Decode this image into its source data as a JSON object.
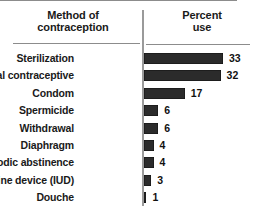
{
  "chart_data": {
    "type": "bar",
    "orientation": "horizontal",
    "title": "",
    "xlabel": "Percent use",
    "ylabel": "Method of contraception",
    "categories": [
      "Sterilization",
      "Oral contraceptive",
      "Condom",
      "Spermicide",
      "Withdrawal",
      "Diaphragm",
      "Periodic abstinence",
      "Intrauterine device (IUD)",
      "Douche"
    ],
    "values": [
      33,
      32,
      17,
      6,
      6,
      4,
      4,
      3,
      1
    ],
    "value_labels": [
      "33",
      "32",
      "17",
      "6",
      "6",
      "4",
      "4",
      "3",
      "1"
    ],
    "xlim": [
      0,
      33
    ],
    "grid": false,
    "legend": null,
    "bar_color": "#2b2b2b",
    "axis_color": "#9a9a9a",
    "rule_color": "#8c8c8c",
    "text_color": "#1a1a1a",
    "background": "#ffffff"
  },
  "header": {
    "left_line1": "Method of",
    "left_line2": "contraception",
    "right_line1": "Percent",
    "right_line2": "use"
  },
  "rows": [
    {
      "label": "Sterilization",
      "value": 33,
      "value_label": "33"
    },
    {
      "label": "Oral contraceptive",
      "value": 32,
      "value_label": "32"
    },
    {
      "label": "Condom",
      "value": 17,
      "value_label": "17"
    },
    {
      "label": "Spermicide",
      "value": 6,
      "value_label": "6"
    },
    {
      "label": "Withdrawal",
      "value": 6,
      "value_label": "6"
    },
    {
      "label": "Diaphragm",
      "value": 4,
      "value_label": "4"
    },
    {
      "label": "Periodic abstinence",
      "value": 4,
      "value_label": "4"
    },
    {
      "label": "Intrauterine device (IUD)",
      "value": 3,
      "value_label": "3"
    },
    {
      "label": "Douche",
      "value": 1,
      "value_label": "1"
    }
  ]
}
